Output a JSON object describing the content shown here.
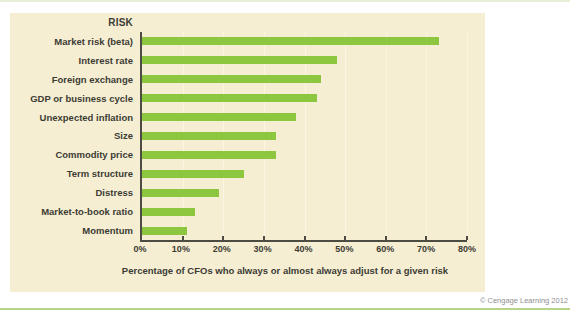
{
  "colors": {
    "panel_background": "#f6eed3",
    "bar": "#8dc63f",
    "axis": "#4c4c42",
    "gridline": "#fbf5e2",
    "ink": "#3c3c33",
    "top_rule": "#e6eed6",
    "bottom_rule": "#b9d488",
    "credit": "#8f8f8f"
  },
  "chart_data": {
    "type": "bar",
    "orientation": "horizontal",
    "title": "RISK",
    "categories": [
      "Market risk (beta)",
      "Interest rate",
      "Foreign exchange",
      "GDP or business cycle",
      "Unexpected inflation",
      "Size",
      "Commodity price",
      "Term structure",
      "Distress",
      "Market-to-book ratio",
      "Momentum"
    ],
    "values": [
      73,
      48,
      44,
      43,
      38,
      33,
      33,
      25,
      19,
      13,
      11
    ],
    "xlabel": "Percentage of CFOs who always or almost always adjust for a given risk",
    "xlim": [
      0,
      80
    ],
    "x_ticks": [
      "0%",
      "10%",
      "20%",
      "30%",
      "40%",
      "50%",
      "60%",
      "70%",
      "80%"
    ],
    "grid": true,
    "legend": "none"
  },
  "footer": {
    "credit": "© Cengage Learning 2012"
  }
}
